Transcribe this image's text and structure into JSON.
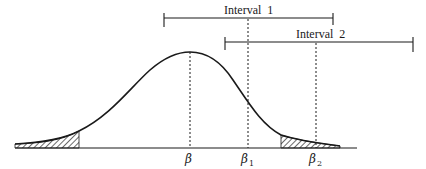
{
  "intervals": [
    {
      "label": "Interval  1",
      "x_start": 164,
      "x_end": 333,
      "y": 18
    },
    {
      "label": "Interval  2",
      "x_start": 225,
      "x_end": 413,
      "y": 42
    }
  ],
  "axis_labels": {
    "beta": {
      "symbol": "β",
      "subscript": ""
    },
    "beta1": {
      "symbol": "β",
      "subscript": "1"
    },
    "beta2": {
      "symbol": "β",
      "subscript": "2"
    }
  },
  "colors": {
    "ink": "#1a1a1a",
    "background": "#ffffff"
  }
}
